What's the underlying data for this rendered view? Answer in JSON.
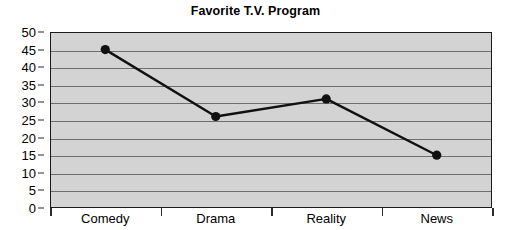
{
  "chart_data": {
    "type": "line",
    "title": "Favorite T.V. Program",
    "xlabel": "",
    "ylabel": "",
    "categories": [
      "Comedy",
      "Drama",
      "Reality",
      "News"
    ],
    "values": [
      45,
      26,
      31,
      15
    ],
    "series": [
      {
        "name": "Favorite T.V. Program",
        "values": [
          45,
          26,
          31,
          15
        ]
      }
    ],
    "ylim": [
      0,
      50
    ],
    "ytick_step": 5,
    "yticks": [
      0,
      5,
      10,
      15,
      20,
      25,
      30,
      35,
      40,
      45,
      50
    ],
    "ytick_labels": [
      "0",
      "5",
      "10",
      "15",
      "20",
      "25",
      "30",
      "35",
      "40",
      "45",
      "50"
    ],
    "grid": true,
    "grid_axis": "y",
    "legend": false,
    "legend_position": "none",
    "marker": "circle",
    "colors": {
      "line": "#111111",
      "marker": "#111111",
      "plot_background": "#d3d3d3",
      "gridline": "#6e6e6e",
      "axis": "#1a1a1a",
      "page_background": "#ffffff",
      "text": "#000000"
    }
  }
}
